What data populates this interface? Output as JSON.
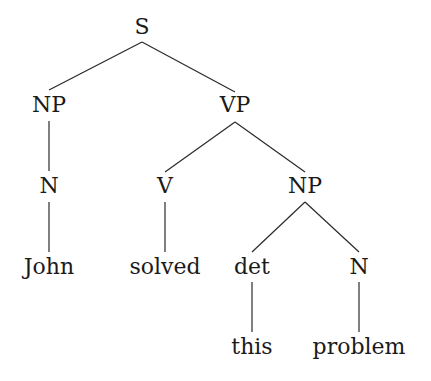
{
  "diagram": {
    "type": "syntax-tree",
    "nodes": [
      {
        "id": "S",
        "label": "S",
        "x": 142,
        "y": 34
      },
      {
        "id": "NP1",
        "label": "NP",
        "x": 49,
        "y": 112
      },
      {
        "id": "VP",
        "label": "VP",
        "x": 235,
        "y": 112
      },
      {
        "id": "N1",
        "label": "N",
        "x": 49,
        "y": 193
      },
      {
        "id": "V",
        "label": "V",
        "x": 165,
        "y": 193
      },
      {
        "id": "NP2",
        "label": "NP",
        "x": 305,
        "y": 193
      },
      {
        "id": "John",
        "label": "John",
        "x": 49,
        "y": 274
      },
      {
        "id": "solved",
        "label": "solved",
        "x": 165,
        "y": 274
      },
      {
        "id": "det",
        "label": "det",
        "x": 252,
        "y": 274
      },
      {
        "id": "N2",
        "label": "N",
        "x": 359,
        "y": 274
      },
      {
        "id": "this",
        "label": "this",
        "x": 252,
        "y": 354
      },
      {
        "id": "problem",
        "label": "problem",
        "x": 359,
        "y": 354
      }
    ],
    "edges": [
      {
        "from": "S",
        "to": "NP1",
        "x1": 142,
        "y1": 42,
        "x2": 49,
        "y2": 90
      },
      {
        "from": "S",
        "to": "VP",
        "x1": 142,
        "y1": 42,
        "x2": 235,
        "y2": 92
      },
      {
        "from": "NP1",
        "to": "N1",
        "x1": 49,
        "y1": 121,
        "x2": 49,
        "y2": 171
      },
      {
        "from": "VP",
        "to": "V",
        "x1": 235,
        "y1": 122,
        "x2": 165,
        "y2": 172
      },
      {
        "from": "VP",
        "to": "NP2",
        "x1": 235,
        "y1": 122,
        "x2": 305,
        "y2": 172
      },
      {
        "from": "N1",
        "to": "John",
        "x1": 49,
        "y1": 202,
        "x2": 49,
        "y2": 252
      },
      {
        "from": "V",
        "to": "solved",
        "x1": 165,
        "y1": 202,
        "x2": 165,
        "y2": 252
      },
      {
        "from": "NP2",
        "to": "det",
        "x1": 305,
        "y1": 202,
        "x2": 252,
        "y2": 252
      },
      {
        "from": "NP2",
        "to": "N2",
        "x1": 305,
        "y1": 202,
        "x2": 359,
        "y2": 252
      },
      {
        "from": "det",
        "to": "this",
        "x1": 252,
        "y1": 282,
        "x2": 252,
        "y2": 332
      },
      {
        "from": "N2",
        "to": "problem",
        "x1": 359,
        "y1": 282,
        "x2": 359,
        "y2": 332
      }
    ]
  }
}
